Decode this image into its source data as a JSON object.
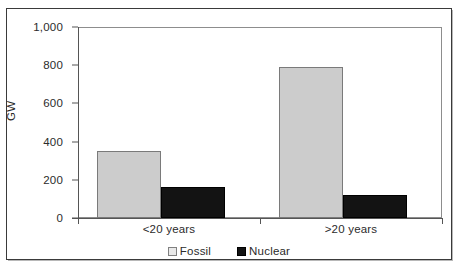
{
  "chart_data": {
    "type": "bar",
    "title": "",
    "xlabel": "",
    "ylabel": "GW",
    "categories": [
      "<20 years",
      ">20 years"
    ],
    "series": [
      {
        "name": "Fossil",
        "values": [
          350,
          790
        ],
        "color": "#cccccc"
      },
      {
        "name": "Nuclear",
        "values": [
          160,
          120
        ],
        "color": "#131313"
      }
    ],
    "ylim": [
      0,
      1000
    ],
    "yticks": [
      0,
      200,
      400,
      600,
      800,
      1000
    ],
    "ytick_labels": [
      "0",
      "200",
      "400",
      "600",
      "800",
      "1,000"
    ],
    "grid": false,
    "legend_position": "bottom"
  },
  "legend": {
    "entries": [
      {
        "label": "Fossil",
        "marker": "light-gray-square"
      },
      {
        "label": "Nuclear",
        "marker": "black-square"
      }
    ]
  },
  "axes": {
    "y_axis_title": "GW"
  }
}
